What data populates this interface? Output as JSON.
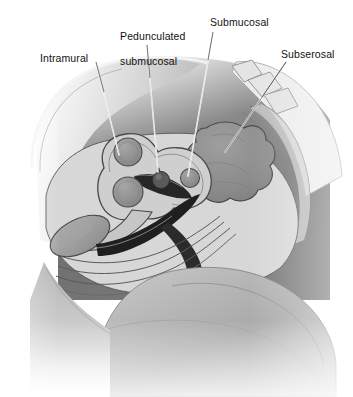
{
  "figure": {
    "type": "medical-illustration",
    "background_color": "#ffffff",
    "label_color": "#121212",
    "leader_line_color": "#f2f2f2"
  },
  "labels": {
    "intramural": "Intramural",
    "pedunculated_line1": "Pedunculated",
    "pedunculated_line2": "submucosal",
    "submucosal": "Submucosal",
    "subserosal": "Subserosal"
  },
  "annotations": [
    {
      "name": "intramural",
      "text": "Intramural",
      "label_x": 40,
      "label_y": 52,
      "leader_from_x": 96,
      "leader_from_y": 62,
      "leader_to_x": 119,
      "leader_to_y": 155
    },
    {
      "name": "pedunculated-submucosal",
      "text": "Pedunculated submucosal",
      "label_x": 108,
      "label_y": 18,
      "leader_from_x": 147,
      "leader_from_y": 45,
      "leader_to_x": 158,
      "leader_to_y": 172
    },
    {
      "name": "submucosal",
      "text": "Submucosal",
      "label_x": 210,
      "label_y": 16,
      "leader_from_x": 213,
      "leader_from_y": 32,
      "leader_to_x": 188,
      "leader_to_y": 176
    },
    {
      "name": "subserosal",
      "text": "Subserosal",
      "label_x": 281,
      "label_y": 48,
      "leader_from_x": 286,
      "leader_from_y": 62,
      "leader_to_x": 225,
      "leader_to_y": 152
    }
  ],
  "anatomy": {
    "body_wall": "abdominal wall",
    "uterus": "uterus",
    "endometrial_cavity": "endometrial cavity",
    "bladder": "urinary bladder",
    "vagina": "vagina",
    "rectum": "rectum",
    "sacrum": "sacrum and vertebrae",
    "thigh": "thigh and buttock"
  },
  "fibroids": [
    {
      "name": "intramural-fibroid-upper",
      "cx": 128,
      "cy": 152,
      "r": 14
    },
    {
      "name": "intramural-fibroid-lower",
      "cx": 128,
      "cy": 192,
      "r": 15
    },
    {
      "name": "pedunculated-submucosal-fibroid",
      "cx": 160,
      "cy": 177,
      "r": 9
    },
    {
      "name": "submucosal-fibroid",
      "cx": 190,
      "cy": 178,
      "r": 9
    },
    {
      "name": "subserosal-fibroid",
      "cx": 228,
      "cy": 155,
      "r": 32
    }
  ],
  "palette": {
    "skin_dark": "#6e6e6e",
    "skin_mid": "#9a9a9a",
    "skin_light": "#c9c9c9",
    "tissue_light": "#d3d3d3",
    "tissue_mid": "#b3b3b3",
    "fibroid_fill": "#8f8f8f",
    "cavity_dark": "#2a2a2a",
    "outline": "#3d3d3d"
  }
}
